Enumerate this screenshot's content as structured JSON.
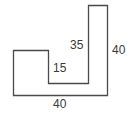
{
  "diagram": {
    "type": "composite-shape-dimensions",
    "shape_outline": [
      [
        13,
        50
      ],
      [
        48,
        50
      ],
      [
        48,
        83
      ],
      [
        88,
        83
      ],
      [
        88,
        5
      ],
      [
        107,
        5
      ],
      [
        107,
        95
      ],
      [
        13,
        95
      ]
    ],
    "stroke_color": "#4a4a4a",
    "fill_color": "#ffffff",
    "labels": {
      "notch_depth": "15",
      "inner_column_height": "35",
      "outer_height": "40",
      "bottom_width": "40"
    }
  }
}
